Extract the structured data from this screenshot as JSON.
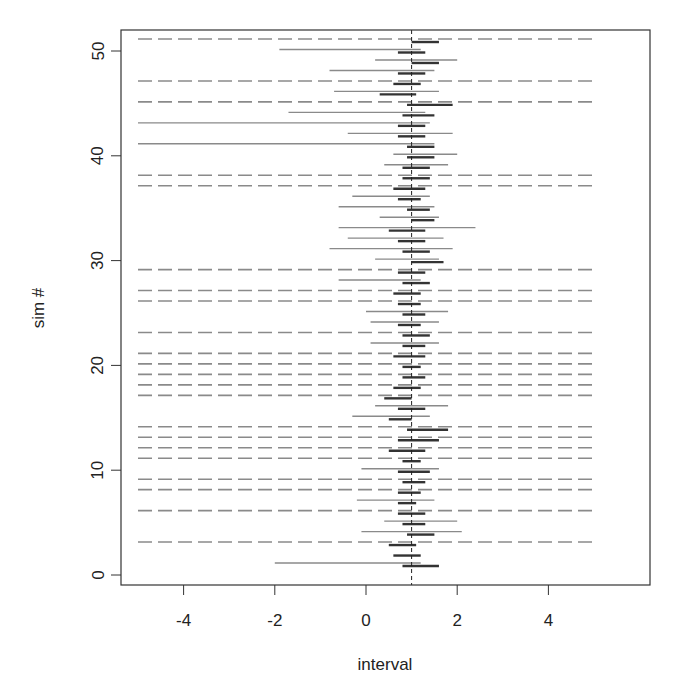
{
  "chart_data": {
    "type": "interval",
    "title": "",
    "xlabel": "interval",
    "ylabel": "sim #",
    "xlim": [
      -5.2,
      5.4
    ],
    "ylim": [
      -1,
      52
    ],
    "x_ticks": [
      -4,
      -2,
      0,
      2,
      4
    ],
    "x_tick_labels": [
      "-4",
      "-2",
      "0",
      "2",
      "4"
    ],
    "y_ticks": [
      0,
      10,
      20,
      30,
      40,
      50
    ],
    "y_tick_labels": [
      "0",
      "10",
      "20",
      "30",
      "40",
      "50"
    ],
    "reference_line": {
      "x": 1,
      "style": "dashed",
      "color": "#222222"
    },
    "grid": false,
    "legend": null,
    "colors": {
      "wide": "#8a8a8a",
      "narrow": "#333333",
      "unbounded_dash": "#8a8a8a",
      "axis": "#333333"
    },
    "series": [
      {
        "name": "wide interval (gray)",
        "note": "rows with null bounds extend across full axis as dashed line (unbounded)",
        "rows": [
          {
            "sim": 1,
            "lo": -2.0,
            "hi": 1.2
          },
          {
            "sim": 3,
            "lo": null,
            "hi": null
          },
          {
            "sim": 4,
            "lo": -0.1,
            "hi": 2.1
          },
          {
            "sim": 5,
            "lo": 0.4,
            "hi": 2.0
          },
          {
            "sim": 6,
            "lo": null,
            "hi": null
          },
          {
            "sim": 7,
            "lo": -0.2,
            "hi": 1.5
          },
          {
            "sim": 8,
            "lo": null,
            "hi": null
          },
          {
            "sim": 9,
            "lo": null,
            "hi": null
          },
          {
            "sim": 10,
            "lo": -0.1,
            "hi": 1.6
          },
          {
            "sim": 11,
            "lo": null,
            "hi": null
          },
          {
            "sim": 12,
            "lo": null,
            "hi": null
          },
          {
            "sim": 13,
            "lo": null,
            "hi": null
          },
          {
            "sim": 14,
            "lo": null,
            "hi": null
          },
          {
            "sim": 15,
            "lo": -0.3,
            "hi": 1.4
          },
          {
            "sim": 16,
            "lo": 0.2,
            "hi": 1.8
          },
          {
            "sim": 17,
            "lo": null,
            "hi": null
          },
          {
            "sim": 18,
            "lo": null,
            "hi": null
          },
          {
            "sim": 19,
            "lo": null,
            "hi": null
          },
          {
            "sim": 20,
            "lo": null,
            "hi": null
          },
          {
            "sim": 21,
            "lo": null,
            "hi": null
          },
          {
            "sim": 22,
            "lo": 0.1,
            "hi": 1.6
          },
          {
            "sim": 23,
            "lo": null,
            "hi": null
          },
          {
            "sim": 24,
            "lo": 0.1,
            "hi": 1.6
          },
          {
            "sim": 25,
            "lo": 0.0,
            "hi": 1.8
          },
          {
            "sim": 26,
            "lo": null,
            "hi": null
          },
          {
            "sim": 27,
            "lo": null,
            "hi": null
          },
          {
            "sim": 28,
            "lo": -0.6,
            "hi": 1.2
          },
          {
            "sim": 29,
            "lo": null,
            "hi": null
          },
          {
            "sim": 30,
            "lo": 0.2,
            "hi": 1.6
          },
          {
            "sim": 31,
            "lo": -0.8,
            "hi": 1.9
          },
          {
            "sim": 32,
            "lo": -0.4,
            "hi": 1.7
          },
          {
            "sim": 33,
            "lo": -0.6,
            "hi": 2.4
          },
          {
            "sim": 34,
            "lo": 0.3,
            "hi": 1.6
          },
          {
            "sim": 35,
            "lo": -0.6,
            "hi": 1.5
          },
          {
            "sim": 36,
            "lo": -0.3,
            "hi": 1.4
          },
          {
            "sim": 37,
            "lo": null,
            "hi": null
          },
          {
            "sim": 38,
            "lo": null,
            "hi": null
          },
          {
            "sim": 39,
            "lo": 0.4,
            "hi": 1.8
          },
          {
            "sim": 40,
            "lo": 0.6,
            "hi": 2.0
          },
          {
            "sim": 41,
            "lo": -5.0,
            "hi": 1.5
          },
          {
            "sim": 42,
            "lo": -0.4,
            "hi": 1.9
          },
          {
            "sim": 43,
            "lo": -5.0,
            "hi": 1.4
          },
          {
            "sim": 44,
            "lo": -1.7,
            "hi": 1.3
          },
          {
            "sim": 45,
            "lo": null,
            "hi": null
          },
          {
            "sim": 46,
            "lo": -0.7,
            "hi": 1.6
          },
          {
            "sim": 47,
            "lo": null,
            "hi": null
          },
          {
            "sim": 48,
            "lo": -0.8,
            "hi": 1.5
          },
          {
            "sim": 49,
            "lo": 0.2,
            "hi": 2.0
          },
          {
            "sim": 50,
            "lo": -1.9,
            "hi": 1.2
          },
          {
            "sim": 51,
            "lo": null,
            "hi": null
          }
        ]
      },
      {
        "name": "narrow interval (dark)",
        "rows": [
          {
            "sim": 1,
            "lo": 0.8,
            "hi": 1.6
          },
          {
            "sim": 2,
            "lo": 0.6,
            "hi": 1.2
          },
          {
            "sim": 3,
            "lo": 0.5,
            "hi": 1.1
          },
          {
            "sim": 4,
            "lo": 0.9,
            "hi": 1.5
          },
          {
            "sim": 5,
            "lo": 0.8,
            "hi": 1.3
          },
          {
            "sim": 6,
            "lo": 0.7,
            "hi": 1.3
          },
          {
            "sim": 7,
            "lo": 0.7,
            "hi": 1.1
          },
          {
            "sim": 8,
            "lo": 0.7,
            "hi": 1.2
          },
          {
            "sim": 9,
            "lo": 0.8,
            "hi": 1.3
          },
          {
            "sim": 10,
            "lo": 0.7,
            "hi": 1.4
          },
          {
            "sim": 11,
            "lo": 0.8,
            "hi": 1.2
          },
          {
            "sim": 12,
            "lo": 0.5,
            "hi": 1.3
          },
          {
            "sim": 13,
            "lo": 0.7,
            "hi": 1.6
          },
          {
            "sim": 14,
            "lo": 0.9,
            "hi": 1.8
          },
          {
            "sim": 15,
            "lo": 0.5,
            "hi": 1.0
          },
          {
            "sim": 16,
            "lo": 0.7,
            "hi": 1.3
          },
          {
            "sim": 17,
            "lo": 0.4,
            "hi": 1.0
          },
          {
            "sim": 18,
            "lo": 0.6,
            "hi": 1.2
          },
          {
            "sim": 19,
            "lo": 0.8,
            "hi": 1.3
          },
          {
            "sim": 20,
            "lo": 0.8,
            "hi": 1.2
          },
          {
            "sim": 21,
            "lo": 0.6,
            "hi": 1.3
          },
          {
            "sim": 22,
            "lo": 0.8,
            "hi": 1.3
          },
          {
            "sim": 23,
            "lo": 0.8,
            "hi": 1.4
          },
          {
            "sim": 24,
            "lo": 0.7,
            "hi": 1.2
          },
          {
            "sim": 25,
            "lo": 0.8,
            "hi": 1.3
          },
          {
            "sim": 26,
            "lo": 0.7,
            "hi": 1.2
          },
          {
            "sim": 27,
            "lo": 0.6,
            "hi": 1.2
          },
          {
            "sim": 28,
            "lo": 0.8,
            "hi": 1.4
          },
          {
            "sim": 29,
            "lo": 0.7,
            "hi": 1.3
          },
          {
            "sim": 30,
            "lo": 1.0,
            "hi": 1.7
          },
          {
            "sim": 31,
            "lo": 0.8,
            "hi": 1.4
          },
          {
            "sim": 32,
            "lo": 0.7,
            "hi": 1.3
          },
          {
            "sim": 33,
            "lo": 0.5,
            "hi": 1.3
          },
          {
            "sim": 34,
            "lo": 1.0,
            "hi": 1.5
          },
          {
            "sim": 35,
            "lo": 0.9,
            "hi": 1.4
          },
          {
            "sim": 36,
            "lo": 0.7,
            "hi": 1.2
          },
          {
            "sim": 37,
            "lo": 0.6,
            "hi": 1.3
          },
          {
            "sim": 38,
            "lo": 0.8,
            "hi": 1.4
          },
          {
            "sim": 39,
            "lo": 0.8,
            "hi": 1.4
          },
          {
            "sim": 40,
            "lo": 0.9,
            "hi": 1.5
          },
          {
            "sim": 41,
            "lo": 0.9,
            "hi": 1.5
          },
          {
            "sim": 42,
            "lo": 0.7,
            "hi": 1.3
          },
          {
            "sim": 43,
            "lo": 0.7,
            "hi": 1.3
          },
          {
            "sim": 44,
            "lo": 0.8,
            "hi": 1.5
          },
          {
            "sim": 45,
            "lo": 0.9,
            "hi": 1.9
          },
          {
            "sim": 46,
            "lo": 0.3,
            "hi": 1.1
          },
          {
            "sim": 47,
            "lo": 0.6,
            "hi": 1.2
          },
          {
            "sim": 48,
            "lo": 0.7,
            "hi": 1.3
          },
          {
            "sim": 49,
            "lo": 1.0,
            "hi": 1.6
          },
          {
            "sim": 50,
            "lo": 0.7,
            "hi": 1.3
          },
          {
            "sim": 51,
            "lo": 1.0,
            "hi": 1.6
          }
        ]
      }
    ]
  }
}
